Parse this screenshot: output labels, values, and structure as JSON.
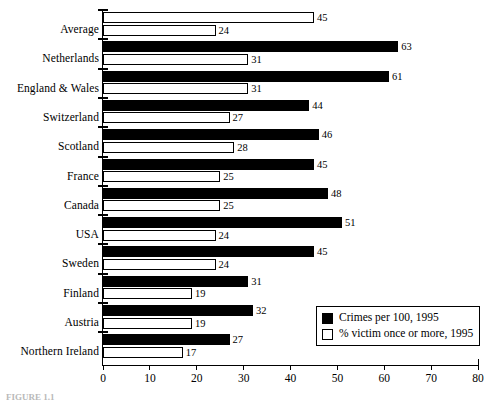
{
  "chart_data": {
    "type": "bar",
    "orientation": "horizontal",
    "title": "",
    "xlabel": "",
    "ylabel": "",
    "xlim": [
      0,
      80
    ],
    "xticks": [
      0,
      10,
      20,
      30,
      40,
      50,
      60,
      70,
      80
    ],
    "grid": false,
    "legend_position": "bottom-right",
    "categories": [
      "Average",
      "Netherlands",
      "England & Wales",
      "Switzerland",
      "Scotland",
      "France",
      "Canada",
      "USA",
      "Sweden",
      "Finland",
      "Austria",
      "Northern Ireland"
    ],
    "series": [
      {
        "name": "Crimes per 100, 1995",
        "style": "solid-black",
        "values": [
          45,
          63,
          61,
          44,
          46,
          45,
          48,
          51,
          45,
          31,
          32,
          27
        ]
      },
      {
        "name": "% victim once or more, 1995",
        "style": "hollow-white",
        "values": [
          24,
          31,
          31,
          27,
          28,
          25,
          25,
          24,
          24,
          19,
          19,
          17
        ]
      }
    ],
    "highlight_row": "Average",
    "highlight_note": "Average row drawn with both bars hollow/outlined"
  },
  "legend": {
    "entries": [
      {
        "swatch": "solid",
        "label": "Crimes per 100, 1995"
      },
      {
        "swatch": "hollow",
        "label": "% victim once or more, 1995"
      }
    ]
  },
  "caption": {
    "text": "FIGURE 1.1"
  },
  "colors": {
    "bar_solid": "#000000",
    "bar_hollow": "#ffffff",
    "axis": "#000000",
    "background": "#ffffff"
  }
}
